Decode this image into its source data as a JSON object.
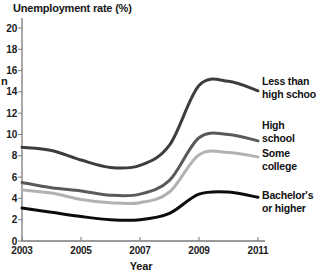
{
  "page": {
    "background_color": "#ffffff",
    "stray_left_edge_text": "n"
  },
  "chart_data": {
    "type": "line",
    "title": "Unemployment rate (%)",
    "xlabel": "Year",
    "ylabel": "",
    "xlim": [
      2003,
      2011
    ],
    "ylim": [
      0,
      20
    ],
    "grid": false,
    "legend_position": "right-of-line-ends",
    "axis_color": "#7b7b7b",
    "tick_label_color": "#1c1c1c",
    "x": [
      2003,
      2004,
      2005,
      2006,
      2007,
      2008,
      2009,
      2010,
      2011
    ],
    "x_tick_labels": [
      "2003",
      "2005",
      "2007",
      "2009",
      "2011"
    ],
    "x_tick_values": [
      2003,
      2005,
      2007,
      2009,
      2011
    ],
    "y_tick_labels": [
      "0",
      "2",
      "4",
      "6",
      "8",
      "10",
      "12",
      "14",
      "16",
      "18",
      "20"
    ],
    "y_tick_values": [
      0,
      2,
      4,
      6,
      8,
      10,
      12,
      14,
      16,
      18,
      20
    ],
    "series": [
      {
        "name": "less-than-high-school",
        "label_lines": [
          "Less than",
          "high school"
        ],
        "color": "#3d3d3d",
        "values": [
          8.8,
          8.5,
          7.6,
          6.9,
          7.1,
          9.0,
          14.6,
          15.0,
          14.1
        ],
        "label_top": 75
      },
      {
        "name": "high-school",
        "label_lines": [
          "High",
          "school"
        ],
        "color": "#5a5a5a",
        "values": [
          5.5,
          5.0,
          4.7,
          4.3,
          4.4,
          5.7,
          9.7,
          10.0,
          9.4
        ],
        "label_top": 119
      },
      {
        "name": "some-college",
        "label_lines": [
          "Some",
          "college"
        ],
        "color": "#b2b2b2",
        "values": [
          4.8,
          4.5,
          3.9,
          3.6,
          3.6,
          4.6,
          8.1,
          8.3,
          7.9
        ],
        "label_top": 147
      },
      {
        "name": "bachelors-or-higher",
        "label_lines": [
          "Bachelor's",
          "or higher"
        ],
        "color": "#0c0c0c",
        "values": [
          3.1,
          2.7,
          2.3,
          2.0,
          2.0,
          2.6,
          4.4,
          4.6,
          4.1
        ],
        "label_top": 189
      }
    ]
  }
}
